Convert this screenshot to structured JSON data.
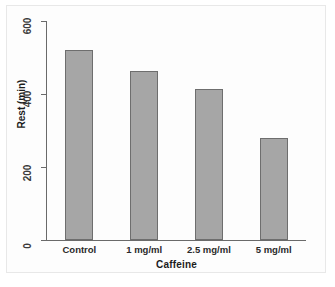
{
  "chart_data": {
    "type": "bar",
    "title": "",
    "subtitle": "",
    "categories": [
      "Control",
      "1 mg/ml",
      "2.5 mg/ml",
      "5 mg/ml"
    ],
    "values": [
      520,
      462,
      415,
      280
    ],
    "xlabel": "Caffeine",
    "ylabel": "Rest (min)",
    "ylim": [
      0,
      600
    ],
    "yticks": [
      0,
      200,
      400,
      600
    ],
    "ytick_labels": [
      "0",
      "200",
      "400",
      "600"
    ],
    "grid": false,
    "legend": null,
    "legend_position": "none",
    "series": [
      {
        "name": "Rest",
        "values": [
          520,
          462,
          415,
          280
        ]
      }
    ],
    "annotations": [],
    "colors": {
      "bar_fill": "#a6a6a6",
      "bar_edge": "#6e6e6e",
      "axis": "#6a6a6a",
      "text": "#1c1c1c",
      "background": "#ffffff",
      "frame": "#e8e8e8"
    }
  },
  "axes": {
    "y_title": "Rest (min)",
    "x_title": "Caffeine",
    "y_tick_0": "0",
    "y_tick_1": "200",
    "y_tick_2": "400",
    "y_tick_3": "600"
  },
  "bars": [
    {
      "label": "Control",
      "value": 520
    },
    {
      "label": "1 mg/ml",
      "value": 462
    },
    {
      "label": "2.5 mg/ml",
      "value": 415
    },
    {
      "label": "5 mg/ml",
      "value": 280
    }
  ]
}
